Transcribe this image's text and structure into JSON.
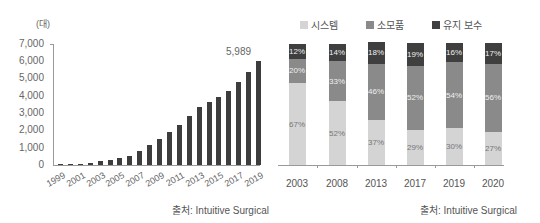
{
  "chart_data": [
    {
      "type": "bar",
      "title": "",
      "unit_label": "(대)",
      "xlabel": "",
      "ylabel": "(대)",
      "ylim": [
        0,
        7000
      ],
      "yticks": [
        "0",
        "1,000",
        "2,000",
        "3,000",
        "4,000",
        "5,000",
        "6,000",
        "7,000"
      ],
      "categories": [
        "1999",
        "2000",
        "2001",
        "2002",
        "2003",
        "2004",
        "2005",
        "2006",
        "2007",
        "2008",
        "2009",
        "2010",
        "2011",
        "2012",
        "2013",
        "2014",
        "2015",
        "2016",
        "2017",
        "2018",
        "2019"
      ],
      "xtick_labels": [
        "1999",
        "2001",
        "2003",
        "2005",
        "2007",
        "2009",
        "2011",
        "2013",
        "2015",
        "2017",
        "2019"
      ],
      "values": [
        30,
        80,
        140,
        210,
        280,
        380,
        530,
        800,
        1150,
        1500,
        1900,
        2300,
        2850,
        3350,
        3650,
        3950,
        4300,
        4800,
        5400,
        5989
      ],
      "annotation": "5,989",
      "source": "출처: Intuitive Surgical"
    },
    {
      "type": "bar",
      "stacked": true,
      "title": "",
      "categories": [
        "2003",
        "2008",
        "2013",
        "2017",
        "2019",
        "2020"
      ],
      "series": [
        {
          "name": "시스템",
          "color": "#d4d4d4",
          "values": [
            67,
            52,
            37,
            29,
            30,
            27
          ]
        },
        {
          "name": "소모품",
          "color": "#8a8a8a",
          "values": [
            20,
            33,
            46,
            52,
            54,
            56
          ]
        },
        {
          "name": "유지 보수",
          "color": "#3f3f3f",
          "values": [
            12,
            14,
            18,
            19,
            16,
            17
          ]
        }
      ],
      "ylim": [
        0,
        100
      ],
      "legend_position": "top",
      "source": "출처: Intuitive Surgical"
    }
  ],
  "left": {
    "unit_label": "(대)",
    "yticks": [
      "0",
      "1,000",
      "2,000",
      "3,000",
      "4,000",
      "5,000",
      "6,000",
      "7,000"
    ],
    "xtick_labels": [
      "1999",
      "2001",
      "2003",
      "2005",
      "2007",
      "2009",
      "2011",
      "2013",
      "2015",
      "2017",
      "2019"
    ],
    "annotation": "5,989",
    "source": "출처: Intuitive Surgical"
  },
  "right": {
    "legend": [
      {
        "label": "시스템",
        "color": "#d4d4d4"
      },
      {
        "label": "소모품",
        "color": "#8a8a8a"
      },
      {
        "label": "유지 보수",
        "color": "#3f3f3f"
      }
    ],
    "bars": [
      {
        "year": "2003",
        "system": "67%",
        "consumables": "20%",
        "service": "12%"
      },
      {
        "year": "2008",
        "system": "52%",
        "consumables": "33%",
        "service": "14%"
      },
      {
        "year": "2013",
        "system": "37%",
        "consumables": "46%",
        "service": "18%"
      },
      {
        "year": "2017",
        "system": "29%",
        "consumables": "52%",
        "service": "19%"
      },
      {
        "year": "2019",
        "system": "30%",
        "consumables": "54%",
        "service": "16%"
      },
      {
        "year": "2020",
        "system": "27%",
        "consumables": "56%",
        "service": "17%"
      }
    ],
    "source": "출처: Intuitive Surgical"
  }
}
